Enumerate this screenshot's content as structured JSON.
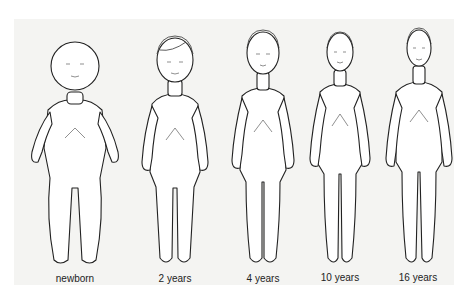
{
  "figure": {
    "type": "body-proportion-diagram",
    "background": "#f4f4f2",
    "stroke_color": "#222222",
    "figures": [
      {
        "label": "newborn",
        "head_ratio": "1/4"
      },
      {
        "label": "2 years",
        "head_ratio": "1/5"
      },
      {
        "label": "4 years",
        "head_ratio": "1/5.5"
      },
      {
        "label": "10 years",
        "head_ratio": "1/6.5"
      },
      {
        "label": "16 years",
        "head_ratio": "1/7"
      }
    ]
  }
}
